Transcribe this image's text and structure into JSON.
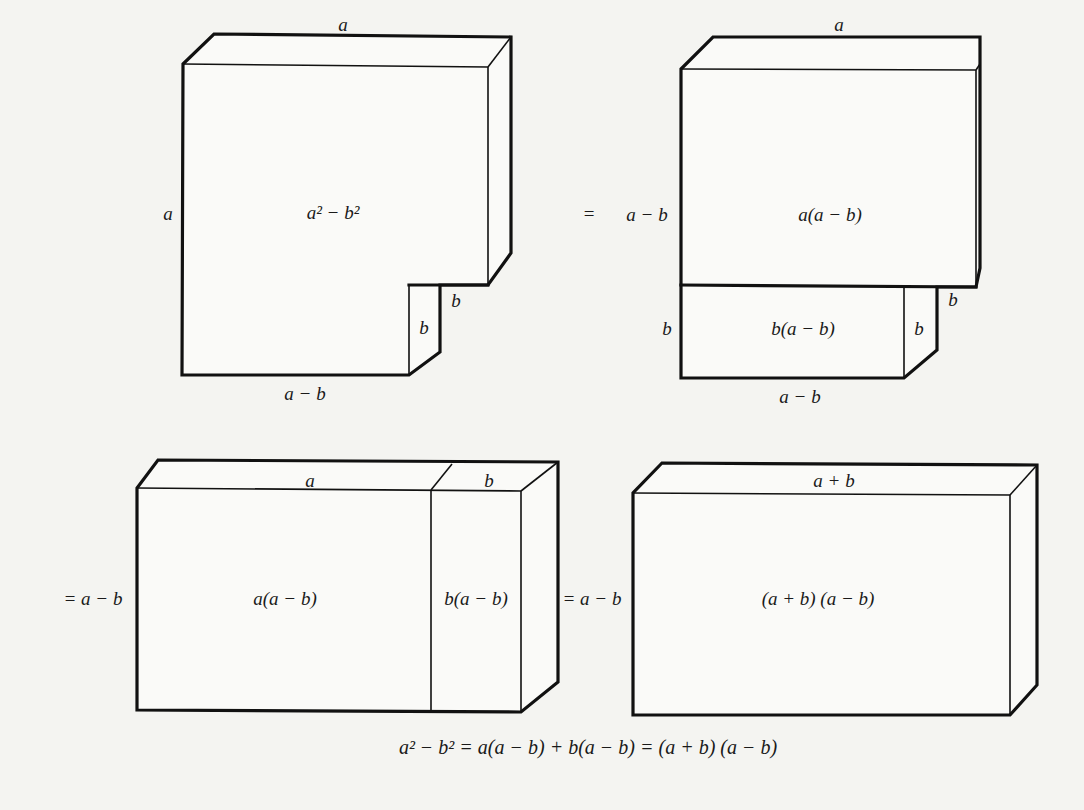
{
  "figure": {
    "colors": {
      "background": "#f4f4f1",
      "face": "#fafaf8",
      "stroke": "#111111"
    }
  },
  "panels": {
    "p1": {
      "top_label": "a",
      "left_label": "a",
      "area_label": "a² − b²",
      "bottom_label": "a − b",
      "notch_side_label": "b",
      "notch_step_label": "b"
    },
    "p2": {
      "prefix": "=",
      "top_label": "a",
      "left_upper_label": "a − b",
      "left_lower_label": "b",
      "upper_area_label": "a(a − b)",
      "lower_area_label": "b(a − b)",
      "notch_side_label": "b",
      "notch_step_label": "b",
      "bottom_label": "a − b"
    },
    "p3": {
      "left_label": "= a − b",
      "top_left_label": "a",
      "top_right_label": "b",
      "left_area_label": "a(a − b)",
      "right_area_label": "b(a − b)"
    },
    "p4": {
      "left_label": "= a − b",
      "top_label": "a + b",
      "area_label": "(a + b) (a − b)"
    }
  },
  "identity": {
    "text": "a² − b² = a(a − b) + b(a − b) = (a + b) (a − b)"
  }
}
